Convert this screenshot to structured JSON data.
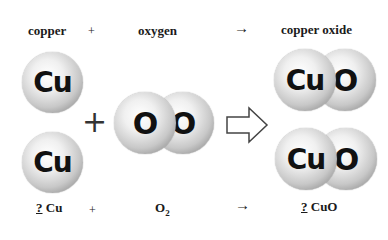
{
  "header": {
    "reactant1": "copper",
    "plus": "+",
    "reactant2": "oxygen",
    "arrow": "→",
    "product": "copper oxide"
  },
  "molecules": {
    "cu_top": "Cu",
    "cu_bottom": "Cu",
    "o2": [
      "O",
      "O"
    ],
    "plus": "+",
    "cuo_top": [
      "Cu",
      "O"
    ],
    "cuo_bottom": [
      "Cu",
      "O"
    ]
  },
  "equation": {
    "coef1": "?",
    "reactant1": "Cu",
    "plus": "+",
    "reactant2_base": "O",
    "reactant2_sub": "2",
    "arrow": "→",
    "coef2": "?",
    "product": "CuO"
  },
  "colors": {
    "atom_light": "#f0f0f0",
    "atom_dark": "#6e6e6e",
    "text": "#1a1a1a"
  }
}
